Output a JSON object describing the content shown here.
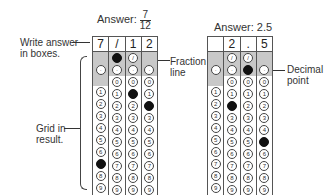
{
  "left": {
    "title_prefix": "Answer:",
    "fraction": {
      "numerator": "7",
      "denominator": "12"
    },
    "boxes": [
      "7",
      "/",
      "1",
      "2"
    ],
    "callouts": {
      "write": "Write answer in boxes.",
      "fraction_line": "Fraction line",
      "grid": "Grid in result."
    },
    "filled": {
      "col0": "7",
      "col1": "/",
      "col2": "1",
      "col3": "2"
    }
  },
  "right": {
    "title": "Answer: 2.5",
    "boxes": [
      "",
      "2",
      ".",
      "5"
    ],
    "callouts": {
      "decimal": "Decimal point"
    },
    "filled": {
      "col1": "2",
      "col2": ".",
      "col3": "5"
    }
  },
  "digits": [
    "0",
    "1",
    "2",
    "3",
    "4",
    "5",
    "6",
    "7",
    "8",
    "9"
  ],
  "symbols": {
    "slash": "⊘",
    "dot": "·"
  }
}
